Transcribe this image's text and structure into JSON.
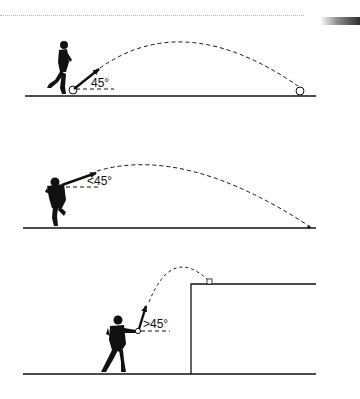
{
  "header": {
    "decor": [
      "dotted-rule",
      "gradient-bar"
    ]
  },
  "panels": [
    {
      "id": "panel-1",
      "angle_label": "45°",
      "description": "Player kicks ball from ground at 45 degrees; dashed arc lands far on ground"
    },
    {
      "id": "panel-2",
      "angle_label": "<45°",
      "description": "Player throws from shoulder height at less than 45 degrees; long dashed arc to ground"
    },
    {
      "id": "panel-3",
      "angle_label": ">45°",
      "description": "Player throws at more than 45 degrees over a wall; short high dashed arc landing on top of wall"
    }
  ],
  "colors": {
    "ink": "#111111",
    "background": "#ffffff"
  }
}
